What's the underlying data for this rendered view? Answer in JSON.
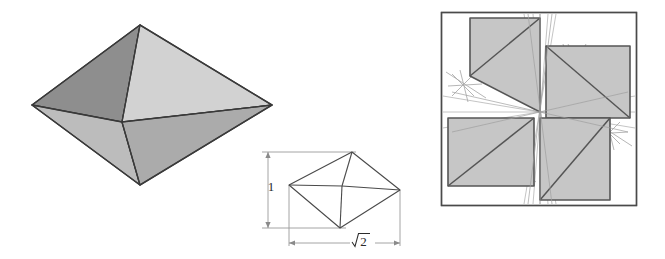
{
  "page": {
    "background_color": "#ffffff",
    "width": 665,
    "height": 259
  },
  "palette": {
    "face_light": "#d0d0d0",
    "face_mid": "#b3b3b3",
    "face_dark": "#8e8e8e",
    "face_darker": "#7d7d7d",
    "edge_dark": "#3a3a3a",
    "wire_line": "#4a4a4a",
    "dim_line": "#8a8a8a",
    "construction_line": "#a8a8a8",
    "square_border": "#4a4a4a",
    "shaded_quad": "#c6c6c6",
    "quad_outline": "#555555",
    "label_color": "#2b2b2b"
  },
  "figures": {
    "solid_octahedron": {
      "name": "shaded 3D octahedron",
      "vertices": {
        "left": [
          32,
          105
        ],
        "apex": [
          140,
          25
        ],
        "right": [
          272,
          105
        ],
        "bottom": [
          140,
          185
        ],
        "center": [
          122,
          122
        ]
      },
      "faces": [
        {
          "id": "upper-left-dark",
          "points": "32,105 140,25 122,122",
          "shade": "#8e8e8e"
        },
        {
          "id": "upper-right-light",
          "points": "140,25 272,105 122,122",
          "shade": "#d0d0d0"
        },
        {
          "id": "lower-left-mid",
          "points": "32,105 122,122 140,185",
          "shade": "#b7b7b7"
        },
        {
          "id": "lower-right-mid",
          "points": "122,122 272,105 140,185",
          "shade": "#aeaeae"
        }
      ]
    },
    "wireframe_octahedron": {
      "name": "wireframe octahedron with dimensions",
      "vertices": {
        "left": [
          289,
          185
        ],
        "apex": [
          352,
          152
        ],
        "right": [
          400,
          190
        ],
        "bottom": [
          340,
          228
        ],
        "center": [
          342,
          186
        ]
      },
      "dimensions": {
        "height": {
          "label": "1",
          "value": 1,
          "orientation": "vertical",
          "label_pos": [
            270,
            186
          ]
        },
        "width": {
          "label": "√2",
          "value": 1.41421356,
          "orientation": "horizontal",
          "label_pos": [
            360,
            245
          ]
        }
      }
    },
    "square_dissection": {
      "name": "square pinwheel dissection",
      "square": {
        "x": 441,
        "y": 12,
        "width": 196,
        "height": 194
      },
      "center": [
        540,
        112
      ],
      "shaded_quads": [
        {
          "id": "quad-top-left",
          "points": "470,18 540,18 540,112 470,76",
          "split": "540,18 470,76"
        },
        {
          "id": "quad-top-right",
          "points": "546,46 630,46 630,118 546,118",
          "split": "546,46 630,118"
        },
        {
          "id": "quad-bottom-left",
          "points": "448,118 534,118 534,186 448,186",
          "split": "448,186 534,118"
        },
        {
          "id": "quad-bottom-right",
          "points": "540,118 610,118 610,200 540,200",
          "split": "610,118 540,200"
        }
      ],
      "construction_marks": 4
    }
  },
  "labels": {
    "height_label": "1",
    "width_label": "√2"
  }
}
